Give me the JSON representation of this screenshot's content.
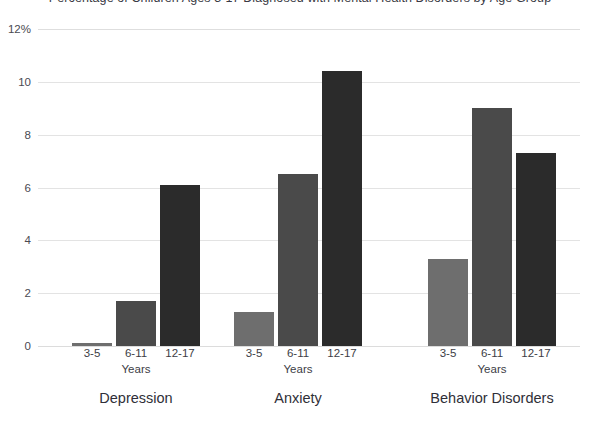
{
  "chart_data": {
    "type": "bar",
    "title": "Percentage of Children Ages 3-17 Diagnosed with Mental Health Disorders by Age Group",
    "xlabel": "Years",
    "ylabel": "",
    "ylim": [
      0,
      12
    ],
    "yticks": [
      "0",
      "2",
      "4",
      "6",
      "8",
      "10",
      "12%"
    ],
    "ytick_values": [
      0,
      2,
      4,
      6,
      8,
      10,
      12
    ],
    "grid": true,
    "legend": "none",
    "categories": [
      "Depression",
      "Anxiety",
      "Behavior Disorders"
    ],
    "subcategories": [
      "3-5",
      "6-11",
      "12-17"
    ],
    "sub_axis_label": "Years",
    "series": [
      {
        "name": "3-5",
        "color": "#6e6e6e",
        "values": [
          0.1,
          1.3,
          3.3
        ]
      },
      {
        "name": "6-11",
        "color": "#4a4a4a",
        "values": [
          1.7,
          6.5,
          9.0
        ]
      },
      {
        "name": "12-17",
        "color": "#2b2b2b",
        "values": [
          6.1,
          10.4,
          7.3
        ]
      }
    ],
    "groups": [
      {
        "label": "Depression",
        "years_label": "Years",
        "bars": [
          {
            "age": "3-5",
            "value": 0.1,
            "color": "#6e6e6e"
          },
          {
            "age": "6-11",
            "value": 1.7,
            "color": "#4a4a4a"
          },
          {
            "age": "12-17",
            "value": 6.1,
            "color": "#2b2b2b"
          }
        ]
      },
      {
        "label": "Anxiety",
        "years_label": "Years",
        "bars": [
          {
            "age": "3-5",
            "value": 1.3,
            "color": "#6e6e6e"
          },
          {
            "age": "6-11",
            "value": 6.5,
            "color": "#4a4a4a"
          },
          {
            "age": "12-17",
            "value": 10.4,
            "color": "#2b2b2b"
          }
        ]
      },
      {
        "label": "Behavior Disorders",
        "years_label": "Years",
        "bars": [
          {
            "age": "3-5",
            "value": 3.3,
            "color": "#6e6e6e"
          },
          {
            "age": "6-11",
            "value": 9.0,
            "color": "#4a4a4a"
          },
          {
            "age": "12-17",
            "value": 7.3,
            "color": "#2b2b2b"
          }
        ]
      }
    ]
  },
  "colors": {
    "background": "#ffffff",
    "gridline": "#e3e3e3",
    "text": "#3d3d45",
    "bar_light": "#6e6e6e",
    "bar_medium": "#4a4a4a",
    "bar_dark": "#2b2b2b"
  }
}
